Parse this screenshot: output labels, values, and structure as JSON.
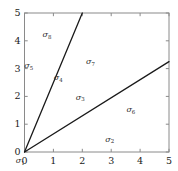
{
  "chart_data": {
    "type": "line",
    "title": "",
    "xlabel": "σ₁",
    "ylabel": "",
    "xlim": [
      0,
      5
    ],
    "ylim": [
      0,
      5
    ],
    "grid": false,
    "legend": "none",
    "x_ticks": [
      "0",
      "1",
      "2",
      "3",
      "4",
      "5"
    ],
    "x_tick_values": [
      0,
      1,
      2,
      3,
      4,
      5
    ],
    "y_ticks": [
      "0",
      "1",
      "2",
      "3",
      "4",
      "5"
    ],
    "y_tick_values": [
      0,
      1,
      2,
      3,
      4,
      5
    ],
    "series": [
      {
        "name": "steep-ray",
        "slope": 2.5,
        "x": [
          0,
          2
        ],
        "y": [
          0,
          5
        ],
        "color": "#1a1a1a"
      },
      {
        "name": "shallow-ray",
        "slope": 0.65,
        "x": [
          0,
          5
        ],
        "y": [
          0,
          3.25
        ],
        "color": "#1a1a1a"
      }
    ],
    "annotations": [
      {
        "text": "σ",
        "sub": "1",
        "x": -0.15,
        "y": -0.33,
        "name": "region-label-sigma-1"
      },
      {
        "text": "σ",
        "sub": "2",
        "x": 2.95,
        "y": 0.43,
        "name": "region-label-sigma-2"
      },
      {
        "text": "σ",
        "sub": "3",
        "x": 1.93,
        "y": 1.96,
        "name": "region-label-sigma-3"
      },
      {
        "text": "σ",
        "sub": "4",
        "x": 1.17,
        "y": 2.65,
        "name": "region-label-sigma-4"
      },
      {
        "text": "σ",
        "sub": "5",
        "x": 0.15,
        "y": 3.08,
        "name": "region-label-sigma-5"
      },
      {
        "text": "σ",
        "sub": "6",
        "x": 3.68,
        "y": 1.5,
        "name": "region-label-sigma-6"
      },
      {
        "text": "σ",
        "sub": "7",
        "x": 2.28,
        "y": 3.23,
        "name": "region-label-sigma-7"
      },
      {
        "text": "σ",
        "sub": "8",
        "x": 0.78,
        "y": 4.2,
        "name": "region-label-sigma-8"
      }
    ],
    "axes_style": {
      "frame_color": "#8a8a8a",
      "line_color": "#1a1a1a",
      "background": "#ffffff",
      "tick_direction": "in"
    }
  }
}
